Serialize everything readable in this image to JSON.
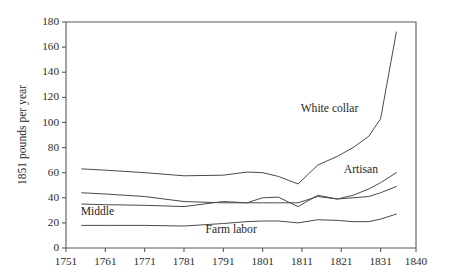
{
  "chart_data": {
    "type": "line",
    "title": "",
    "xlabel": "",
    "ylabel": "1851 pounds per year",
    "xlim": [
      1751,
      1840
    ],
    "ylim": [
      0,
      180
    ],
    "grid": false,
    "legend_position": "inline-annotations",
    "x_ticks": [
      1751,
      1761,
      1771,
      1781,
      1791,
      1801,
      1811,
      1821,
      1831,
      1840
    ],
    "y_ticks": [
      0,
      20,
      40,
      60,
      80,
      100,
      120,
      140,
      160,
      180
    ],
    "series": [
      {
        "name": "White collar",
        "label_x": 1818,
        "label_y": 108,
        "x": [
          1755,
          1761,
          1771,
          1781,
          1791,
          1797,
          1801,
          1805,
          1810,
          1815,
          1820,
          1824,
          1828,
          1831,
          1835
        ],
        "values": [
          63,
          62,
          60,
          57.5,
          58,
          60.5,
          60,
          57,
          51,
          66,
          73,
          80,
          89,
          103,
          172
        ]
      },
      {
        "name": "Artisan",
        "label_x": 1826,
        "label_y": 60,
        "x": [
          1755,
          1761,
          1771,
          1781,
          1791,
          1797,
          1801,
          1805,
          1810,
          1815,
          1820,
          1824,
          1828,
          1831,
          1835
        ],
        "values": [
          44,
          43,
          41,
          37,
          36,
          36,
          36,
          36,
          36,
          41,
          39,
          42,
          47,
          52,
          60
        ]
      },
      {
        "name": "Middle",
        "label_x": 1759,
        "label_y": 26,
        "x": [
          1755,
          1761,
          1771,
          1781,
          1791,
          1797,
          1801,
          1805,
          1810,
          1815,
          1820,
          1824,
          1828,
          1831,
          1835
        ],
        "values": [
          35,
          34.5,
          34,
          33,
          37,
          36,
          40,
          40.5,
          33,
          42,
          39,
          40,
          41,
          44,
          49
        ]
      },
      {
        "name": "Farm labor",
        "label_x": 1793,
        "label_y": 12,
        "x": [
          1755,
          1761,
          1771,
          1781,
          1791,
          1797,
          1801,
          1805,
          1810,
          1815,
          1820,
          1824,
          1828,
          1831,
          1835
        ],
        "values": [
          18,
          18,
          18,
          17.5,
          19.5,
          21,
          21.5,
          21.5,
          20,
          22.5,
          22,
          21,
          21,
          23,
          27
        ]
      }
    ]
  },
  "colors": {
    "line": "#4a4a4a",
    "axis": "#595959",
    "text": "#1f1f1f",
    "background": "#ffffff"
  }
}
